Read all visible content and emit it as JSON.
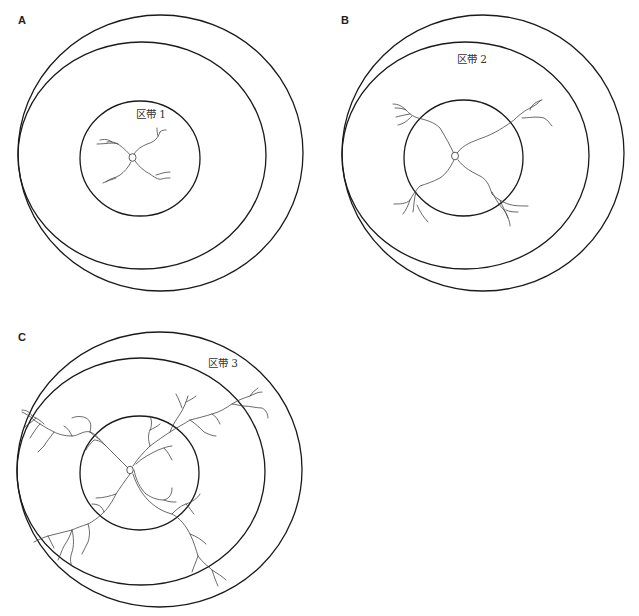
{
  "figure": {
    "panels": [
      {
        "letter": "A",
        "zone_label": "区带 1"
      },
      {
        "letter": "B",
        "zone_label": "区带 2"
      },
      {
        "letter": "C",
        "zone_label": "区带 3"
      }
    ]
  }
}
